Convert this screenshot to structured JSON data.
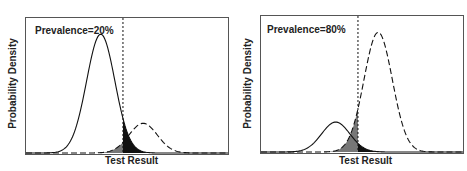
{
  "chart_data": [
    {
      "type": "area",
      "title": "",
      "annotation": "Prevalence=20%",
      "xlabel": "Test Result",
      "ylabel": "Probability Density",
      "grid": false,
      "threshold_line": {
        "style": "dotted",
        "x_rel": 0.48
      },
      "series": [
        {
          "name": "Non-diseased",
          "style": "solid",
          "mean_rel": 0.37,
          "sd_rel": 0.07,
          "peak_rel": 0.88,
          "prevalence": 0.8
        },
        {
          "name": "Diseased",
          "style": "dashed",
          "mean_rel": 0.58,
          "sd_rel": 0.07,
          "peak_rel": 0.22,
          "prevalence": 0.2
        }
      ],
      "shaded_regions": [
        {
          "name": "false positives",
          "color": "#111111"
        },
        {
          "name": "false negatives",
          "color": "#777777"
        }
      ]
    },
    {
      "type": "area",
      "title": "",
      "annotation": "Prevalence=80%",
      "xlabel": "Test Result",
      "ylabel": "Probability Density",
      "grid": false,
      "threshold_line": {
        "style": "dotted",
        "x_rel": 0.48
      },
      "series": [
        {
          "name": "Non-diseased",
          "style": "solid",
          "mean_rel": 0.37,
          "sd_rel": 0.07,
          "peak_rel": 0.22,
          "prevalence": 0.2
        },
        {
          "name": "Diseased",
          "style": "dashed",
          "mean_rel": 0.58,
          "sd_rel": 0.07,
          "peak_rel": 0.88,
          "prevalence": 0.8
        }
      ],
      "shaded_regions": [
        {
          "name": "false positives",
          "color": "#111111"
        },
        {
          "name": "false negatives",
          "color": "#777777"
        }
      ]
    }
  ],
  "panels": [
    {
      "annotation": "Prevalence=20%",
      "xlabel": "Test Result",
      "ylabel": "Probability Density"
    },
    {
      "annotation": "Prevalence=80%",
      "xlabel": "Test Result",
      "ylabel": "Probability Density"
    }
  ]
}
